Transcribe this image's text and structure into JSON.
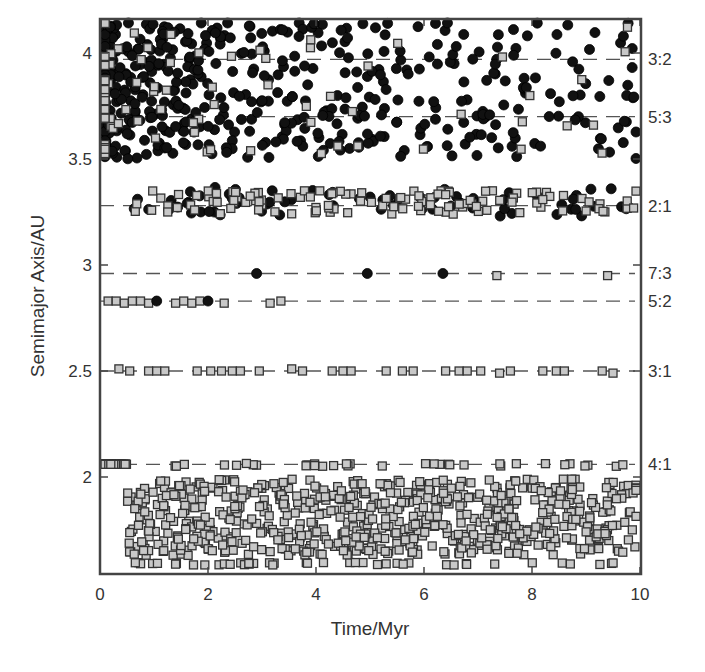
{
  "chart_data": {
    "type": "scatter",
    "title": "",
    "xlabel": "Time/Myr",
    "ylabel": "Semimajor Axis/AU",
    "xlim": [
      0,
      10
    ],
    "ylim": [
      1.56,
      4.15
    ],
    "grid": false,
    "legend": null,
    "x_ticks": [
      0,
      2,
      4,
      6,
      8,
      10
    ],
    "x_tick_labels": [
      "0",
      "2",
      "4",
      "6",
      "8",
      "10"
    ],
    "y_ticks": [
      2,
      2.5,
      3,
      3.5,
      4
    ],
    "y_tick_labels": [
      "2",
      "2.5",
      "3",
      "3.5",
      "4"
    ],
    "resonances": [
      {
        "label": "3:2",
        "a": 3.97
      },
      {
        "label": "5:3",
        "a": 3.7
      },
      {
        "label": "2:1",
        "a": 3.28
      },
      {
        "label": "7:3",
        "a": 2.96
      },
      {
        "label": "5:2",
        "a": 2.83
      },
      {
        "label": "3:1",
        "a": 2.5
      },
      {
        "label": "4:1",
        "a": 2.06
      }
    ],
    "marker_types": {
      "circle": {
        "fill": "#111111",
        "stroke": "#000000",
        "radius": 5
      },
      "square": {
        "fill": "#c8c8c8",
        "stroke": "#333333",
        "size": 8
      }
    },
    "explicit_points": {
      "res_7_3": [
        {
          "t": 2.9,
          "a": 2.96,
          "m": "circle"
        },
        {
          "t": 4.95,
          "a": 2.96,
          "m": "circle"
        },
        {
          "t": 6.35,
          "a": 2.96,
          "m": "circle"
        },
        {
          "t": 7.35,
          "a": 2.95,
          "m": "square"
        },
        {
          "t": 9.4,
          "a": 2.95,
          "m": "square"
        }
      ],
      "res_5_2": [
        {
          "t": 0.15,
          "a": 2.83,
          "m": "square"
        },
        {
          "t": 0.3,
          "a": 2.83,
          "m": "square"
        },
        {
          "t": 0.45,
          "a": 2.82,
          "m": "square"
        },
        {
          "t": 0.6,
          "a": 2.83,
          "m": "square"
        },
        {
          "t": 0.75,
          "a": 2.83,
          "m": "square"
        },
        {
          "t": 0.9,
          "a": 2.82,
          "m": "square"
        },
        {
          "t": 1.05,
          "a": 2.83,
          "m": "circle"
        },
        {
          "t": 1.4,
          "a": 2.82,
          "m": "square"
        },
        {
          "t": 1.55,
          "a": 2.83,
          "m": "square"
        },
        {
          "t": 1.7,
          "a": 2.82,
          "m": "square"
        },
        {
          "t": 1.85,
          "a": 2.83,
          "m": "square"
        },
        {
          "t": 2.0,
          "a": 2.83,
          "m": "circle"
        },
        {
          "t": 2.3,
          "a": 2.82,
          "m": "square"
        },
        {
          "t": 3.15,
          "a": 2.82,
          "m": "square"
        },
        {
          "t": 3.35,
          "a": 2.83,
          "m": "square"
        }
      ],
      "res_3_1": [
        {
          "t": 0.35,
          "a": 2.51,
          "m": "square"
        },
        {
          "t": 0.55,
          "a": 2.5,
          "m": "square"
        },
        {
          "t": 0.9,
          "a": 2.5,
          "m": "square"
        },
        {
          "t": 1.05,
          "a": 2.5,
          "m": "square"
        },
        {
          "t": 1.2,
          "a": 2.5,
          "m": "square"
        },
        {
          "t": 1.8,
          "a": 2.5,
          "m": "square"
        },
        {
          "t": 2.05,
          "a": 2.5,
          "m": "square"
        },
        {
          "t": 2.25,
          "a": 2.5,
          "m": "square"
        },
        {
          "t": 2.45,
          "a": 2.5,
          "m": "square"
        },
        {
          "t": 2.6,
          "a": 2.5,
          "m": "square"
        },
        {
          "t": 2.95,
          "a": 2.5,
          "m": "square"
        },
        {
          "t": 3.55,
          "a": 2.51,
          "m": "square"
        },
        {
          "t": 3.75,
          "a": 2.5,
          "m": "square"
        },
        {
          "t": 4.3,
          "a": 2.5,
          "m": "square"
        },
        {
          "t": 4.5,
          "a": 2.5,
          "m": "square"
        },
        {
          "t": 4.65,
          "a": 2.5,
          "m": "square"
        },
        {
          "t": 5.3,
          "a": 2.5,
          "m": "square"
        },
        {
          "t": 5.6,
          "a": 2.5,
          "m": "square"
        },
        {
          "t": 5.8,
          "a": 2.5,
          "m": "square"
        },
        {
          "t": 6.4,
          "a": 2.5,
          "m": "square"
        },
        {
          "t": 6.65,
          "a": 2.5,
          "m": "square"
        },
        {
          "t": 6.8,
          "a": 2.5,
          "m": "square"
        },
        {
          "t": 7.05,
          "a": 2.5,
          "m": "square"
        },
        {
          "t": 7.4,
          "a": 2.49,
          "m": "square"
        },
        {
          "t": 7.6,
          "a": 2.5,
          "m": "square"
        },
        {
          "t": 8.2,
          "a": 2.5,
          "m": "square"
        },
        {
          "t": 8.45,
          "a": 2.5,
          "m": "square"
        },
        {
          "t": 8.6,
          "a": 2.5,
          "m": "square"
        },
        {
          "t": 9.3,
          "a": 2.5,
          "m": "square"
        },
        {
          "t": 9.5,
          "a": 2.49,
          "m": "square"
        }
      ]
    },
    "scatter_regions": [
      {
        "name": "outer-belt-circles",
        "marker": "circle",
        "count": 520,
        "t_range": [
          0,
          10
        ],
        "a_range": [
          3.5,
          4.15
        ],
        "density": "decreasing-in-time"
      },
      {
        "name": "outer-belt-squares",
        "marker": "square",
        "count": 75,
        "t_range": [
          0,
          10
        ],
        "a_range": [
          3.52,
          4.14
        ],
        "density": "concentrated-early"
      },
      {
        "name": "band-2-1-circles",
        "marker": "circle",
        "count": 70,
        "t_range": [
          0.35,
          10
        ],
        "a_range": [
          3.23,
          3.37
        ],
        "density": "uniform"
      },
      {
        "name": "band-2-1-squares",
        "marker": "square",
        "count": 120,
        "t_range": [
          0.6,
          10
        ],
        "a_range": [
          3.24,
          3.35
        ],
        "density": "uniform"
      },
      {
        "name": "inner-belt-squares",
        "marker": "square",
        "count": 820,
        "t_range": [
          0,
          10
        ],
        "a_range": [
          1.57,
          2.07
        ],
        "density": "uniform"
      }
    ],
    "seed": 12345
  }
}
